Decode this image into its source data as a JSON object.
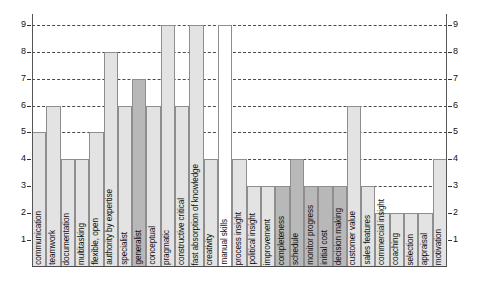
{
  "chart_data": {
    "type": "bar",
    "title": "",
    "subtitle": "",
    "xlabel": "",
    "ylabel": "",
    "ylim": [
      0,
      9.4
    ],
    "yticks": [
      1,
      2,
      3,
      4,
      5,
      6,
      7,
      8,
      9
    ],
    "ytick_labels": [
      "1",
      "2",
      "3",
      "4",
      "5",
      "6",
      "7",
      "8",
      "9"
    ],
    "grid": true,
    "grid_style": "dashed-horizontal",
    "right_axis_labels": [
      "1",
      "2",
      "3",
      "4",
      "5",
      "6",
      "7",
      "8",
      "9"
    ],
    "legend": [],
    "legend_position": "none",
    "bar_colors": {
      "light": "#e3e3e3",
      "dark": "#b8b8b8",
      "white": "#ffffff",
      "outline": "#8e8e8e"
    },
    "categories": [
      "communication",
      "teamwork",
      "documentation",
      "multitasking",
      "flexible, open",
      "authority by expertise",
      "specialist",
      "generalist",
      "conceptual",
      "pragmatic",
      "constructive critical",
      "fast absorption of knowledge",
      "creativity",
      "manual skills",
      "process insight",
      "political insight",
      "improvement",
      "completeness",
      "schedule",
      "monitor progress",
      "initial cost",
      "decision making",
      "customer value",
      "sales features",
      "commercial insight",
      "coaching",
      "selection",
      "appraisal",
      "motivation"
    ],
    "values": [
      5,
      6,
      4,
      4,
      5,
      8,
      6,
      7,
      6,
      9,
      6,
      9,
      4,
      9,
      4,
      3,
      3,
      3,
      4,
      3,
      3,
      3,
      6,
      3,
      2,
      2,
      2,
      2,
      4
    ],
    "fills": [
      "light",
      "light",
      "light",
      "light",
      "light",
      "light",
      "light",
      "dark",
      "light",
      "light",
      "light",
      "light",
      "light",
      "white",
      "light",
      "light",
      "light",
      "dark",
      "dark",
      "dark",
      "dark",
      "dark",
      "light",
      "light",
      "light",
      "light",
      "light",
      "light",
      "light"
    ]
  }
}
